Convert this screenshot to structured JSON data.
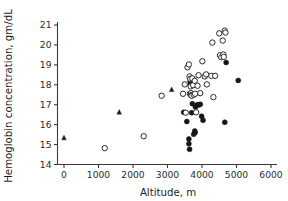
{
  "chart_data": {
    "type": "scatter",
    "title": "",
    "xlabel": "Altitude, m",
    "ylabel": "Hemoglobin concentration, gm/dL",
    "xlim": [
      -250,
      6000
    ],
    "ylim": [
      14,
      21.4
    ],
    "grid": false,
    "legend": "none",
    "xticks": [
      0,
      1000,
      2000,
      3000,
      4000,
      5000,
      6000
    ],
    "xtick_labels": [
      "0",
      "1000",
      "2000",
      "3000",
      "4000",
      "5000",
      "6000"
    ],
    "yticks": [
      14,
      15,
      16,
      17,
      18,
      19,
      20,
      21
    ],
    "ytick_labels": [
      "14",
      "15",
      "16",
      "17",
      "18",
      "19",
      "20",
      "21"
    ],
    "series": [
      {
        "name": "filled-circle",
        "marker": "filled-circle",
        "color": "#161616",
        "points": [
          [
            3470,
            16.62
          ],
          [
            3560,
            16.16
          ],
          [
            3620,
            15.28
          ],
          [
            3620,
            15.04
          ],
          [
            3640,
            14.76
          ],
          [
            3650,
            18.35
          ],
          [
            3660,
            18.18
          ],
          [
            3660,
            18.02
          ],
          [
            3670,
            17.95
          ],
          [
            3680,
            18.12
          ],
          [
            3700,
            16.6
          ],
          [
            3720,
            17.05
          ],
          [
            3760,
            15.52
          ],
          [
            3790,
            15.68
          ],
          [
            3800,
            15.6
          ],
          [
            3810,
            16.88
          ],
          [
            3860,
            17.0
          ],
          [
            3900,
            16.98
          ],
          [
            3950,
            17.02
          ],
          [
            3990,
            16.42
          ],
          [
            4030,
            16.22
          ],
          [
            4660,
            16.12
          ],
          [
            4700,
            19.12
          ],
          [
            5050,
            18.22
          ]
        ]
      },
      {
        "name": "open-circle",
        "marker": "open-circle",
        "color": "#2a2a2a",
        "points": [
          [
            1180,
            14.82
          ],
          [
            2310,
            15.42
          ],
          [
            2830,
            17.45
          ],
          [
            3450,
            17.55
          ],
          [
            3500,
            18.02
          ],
          [
            3530,
            16.6
          ],
          [
            3580,
            18.88
          ],
          [
            3620,
            19.02
          ],
          [
            3640,
            18.42
          ],
          [
            3650,
            17.55
          ],
          [
            3660,
            18.3
          ],
          [
            3670,
            17.92
          ],
          [
            3680,
            17.58
          ],
          [
            3690,
            17.48
          ],
          [
            3700,
            17.45
          ],
          [
            3720,
            18.32
          ],
          [
            3740,
            17.98
          ],
          [
            3760,
            17.5
          ],
          [
            3790,
            18.2
          ],
          [
            3800,
            17.55
          ],
          [
            3830,
            16.62
          ],
          [
            3870,
            17.95
          ],
          [
            3900,
            18.48
          ],
          [
            3950,
            17.58
          ],
          [
            4010,
            19.18
          ],
          [
            4080,
            18.42
          ],
          [
            4120,
            18.52
          ],
          [
            4140,
            18.02
          ],
          [
            4270,
            18.45
          ],
          [
            4300,
            20.12
          ],
          [
            4330,
            17.38
          ],
          [
            4380,
            18.45
          ],
          [
            4500,
            20.58
          ],
          [
            4520,
            19.48
          ],
          [
            4560,
            19.38
          ],
          [
            4600,
            20.22
          ],
          [
            4620,
            19.52
          ],
          [
            4630,
            19.4
          ],
          [
            4660,
            20.72
          ],
          [
            4680,
            20.62
          ]
        ]
      },
      {
        "name": "filled-triangle",
        "marker": "filled-triangle",
        "color": "#161616",
        "points": [
          [
            0,
            15.33
          ],
          [
            1600,
            16.62
          ],
          [
            3120,
            17.75
          ]
        ]
      }
    ]
  },
  "axes": {
    "x_title": "Altitude, m",
    "y_title": "Hemoglobin concentration, gm/dL"
  }
}
